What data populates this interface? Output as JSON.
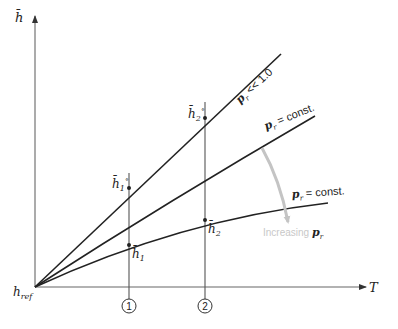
{
  "diagram": {
    "axes": {
      "y_label": "h̄",
      "x_label": "T",
      "origin_label": "h",
      "origin_sub": "ref"
    },
    "curves": [
      {
        "id": "ideal",
        "label_p": "p",
        "label_sub": "r",
        "label_rest": " << 1.0"
      },
      {
        "id": "mid",
        "label_p": "p",
        "label_sub": "r",
        "label_rest": " = const."
      },
      {
        "id": "low",
        "label_p": "p",
        "label_sub": "r",
        "label_rest": " = const."
      }
    ],
    "points": {
      "h1_star": {
        "base": "h̄",
        "sub": "1",
        "sup": "∘"
      },
      "h2_star": {
        "base": "h̄",
        "sub": "2",
        "sup": "∘"
      },
      "h1": {
        "base": "h̄",
        "sub": "1"
      },
      "h2": {
        "base": "h̄",
        "sub": "2"
      }
    },
    "states": [
      {
        "id": "state-1",
        "label": "1"
      },
      {
        "id": "state-2",
        "label": "2"
      }
    ],
    "arrow_annotation": {
      "text": "Increasing ",
      "p": "p",
      "sub": "r",
      "color": "#c8c8c8"
    },
    "colors": {
      "line": "#222222",
      "vertical": "#555555",
      "arrow": "#c4c4c4"
    }
  }
}
